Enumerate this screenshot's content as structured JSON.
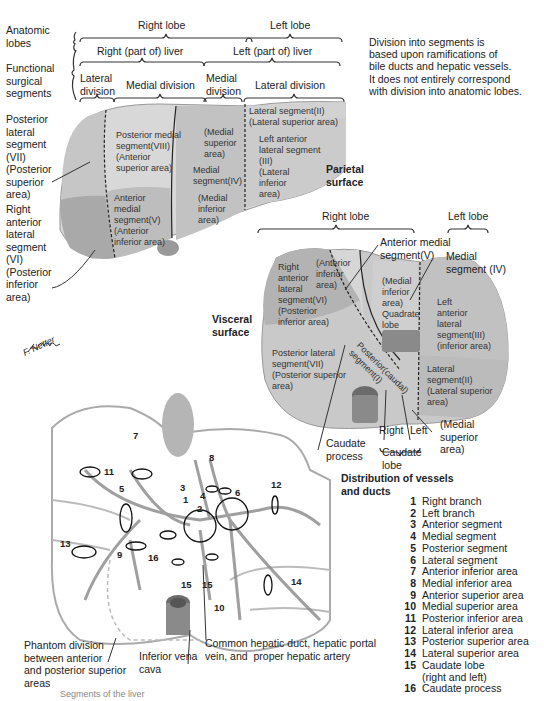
{
  "header": {
    "anatomic_lobes_label": "Anatomic\nlobes",
    "right_lobe": "Right lobe",
    "left_lobe": "Left lobe",
    "functional_label": "Functional\nsurgical\nsegments",
    "right_liver": "Right (part of) liver",
    "left_liver": "Left (part of) liver",
    "lateral_division_r": "Lateral\ndivision",
    "medial_division_r": "Medial division",
    "medial_division_l": "Medial\ndivision",
    "lateral_division_l": "Lateral division"
  },
  "note": "Division into segments is\nbased upon ramifications of\nbile ducts and hepatic vessels.\nIt does not entirely correspond\nwith division into anatomic lobes.",
  "parietal": {
    "title": "Parietal\nsurface",
    "seg7_label": "Posterior\nlateral\nsegment\n(VII)\n(Posterior\nsuperior\narea)",
    "seg6_label": "Right\nanterior\nlateral\nsegment\n(VI)\n(Posterior\ninferior\narea)",
    "seg8": "Posterior medial\nsegment(VIII)\n(Anterior\nsuperior area)",
    "seg5": "Anterior\nmedial\nsegment(V)\n(Anterior\ninferior area)",
    "med_sup": "(Medial\nsuperior\narea)",
    "seg4": "Medial\nsegment(IV)",
    "med_inf": "(Medial\ninferior\narea)",
    "seg2": "Lateral segment(II)\n(Lateral superior area)",
    "seg3": "Left anterior\nlateral segment\n(III)\n(Lateral\ninferior\narea)"
  },
  "visceral": {
    "title": "Visceral\nsurface",
    "right_lobe": "Right lobe",
    "left_lobe": "Left lobe",
    "ant_medial": "Anterior medial\nsegment(V)",
    "medial_seg": "Medial\nsegment (IV)",
    "seg6": "Right\nanterior\nlateral\nsegment(VI)\n(Posterior\ninferior area)",
    "ant_inf": "(Anterior\ninferior\narea)",
    "med_inf_quad": "(Medial\ninferior\narea)\nQuadrate\nlobe",
    "seg3": "Left\nanterior\nlateral\nsegment(III)\n(inferior area)",
    "seg7": "Posterior lateral\nsegment(VII)\n(Posterior superior\narea)",
    "caudal": "Posterior(caudal)\nsegment(I)",
    "seg2": "Lateral\nsegment(II)\n(Lateral superior\narea)",
    "caudate_process": "Caudate\nprocess",
    "right": "Right",
    "left": "Left",
    "caudate_lobe": "Caudate\nlobe",
    "med_sup": "(Medial\nsuperior\narea)"
  },
  "signature": "F. Netter",
  "vessels": {
    "title": "Distribution of vessels\nand ducts",
    "numbers": [
      "11",
      "7",
      "5",
      "3",
      "1",
      "2",
      "4",
      "6",
      "8",
      "12",
      "13",
      "9",
      "16",
      "15",
      "15",
      "10",
      "14"
    ],
    "phantom": "Phantom division\nbetween anterior\nand posterior superior\nareas",
    "ivc": "Inferior vena\ncava",
    "common": "Common hepatic duct, hepatic portal\nvein, and  proper hepatic artery"
  },
  "legend": [
    {
      "n": "1",
      "label": "Right branch"
    },
    {
      "n": "2",
      "label": "Left branch"
    },
    {
      "n": "3",
      "label": "Anterior segment"
    },
    {
      "n": "4",
      "label": "Medial segment"
    },
    {
      "n": "5",
      "label": "Posterior segment"
    },
    {
      "n": "6",
      "label": "Lateral segment"
    },
    {
      "n": "7",
      "label": "Anterior inferior area"
    },
    {
      "n": "8",
      "label": "Medial inferior area"
    },
    {
      "n": "9",
      "label": "Anterior superior area"
    },
    {
      "n": "10",
      "label": "Medial superior area"
    },
    {
      "n": "11",
      "label": "Posterior inferior area"
    },
    {
      "n": "12",
      "label": "Lateral inferior area"
    },
    {
      "n": "13",
      "label": "Posterior superior area"
    },
    {
      "n": "14",
      "label": "Lateral superior area"
    },
    {
      "n": "15",
      "label": "Caudate lobe\n(right and left)"
    },
    {
      "n": "16",
      "label": "Caudate process"
    }
  ],
  "caption": "Segments of the liver",
  "colors": {
    "liver_light": "#dcdcdc",
    "liver_mid": "#c4c4c4",
    "liver_dark": "#aaaaaa",
    "line": "#333333"
  }
}
